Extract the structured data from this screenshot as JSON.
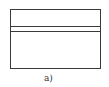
{
  "figure": {
    "caption": "a)",
    "shape": "rectangle",
    "divider_lines": 2,
    "stroke_color": "#3a3a3a"
  }
}
